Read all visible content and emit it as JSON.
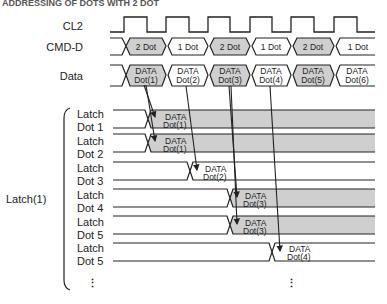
{
  "header": {
    "clipped_text": "ADDRESSING OF DOTS WITH 2 DOT"
  },
  "signals": {
    "cl2": {
      "label": "CL2"
    },
    "cmd_d": {
      "label": "CMD-D",
      "segments": [
        "2 Dot",
        "1 Dot",
        "2 Dot",
        "1 Dot",
        "2 Dot",
        "1 Dot"
      ],
      "shaded": [
        true,
        false,
        true,
        false,
        true,
        false
      ]
    },
    "data": {
      "label": "Data",
      "segments": [
        {
          "l1": "DATA",
          "l2": "Dot(1)",
          "shaded": true
        },
        {
          "l1": "DATA",
          "l2": "Dot(2)",
          "shaded": false
        },
        {
          "l1": "DATA",
          "l2": "Dot(3)",
          "shaded": true
        },
        {
          "l1": "DATA",
          "l2": "Dot(4)",
          "shaded": false
        },
        {
          "l1": "DATA",
          "l2": "Dot(5)",
          "shaded": true
        },
        {
          "l1": "DATA",
          "l2": "Dot(6)",
          "shaded": false
        }
      ]
    }
  },
  "group": {
    "label": "Latch(1)"
  },
  "latches": [
    {
      "l1": "Latch",
      "l2": "Dot 1",
      "d1": "DATA",
      "d2": "Dot(1)",
      "shaded": true
    },
    {
      "l1": "Latch",
      "l2": "Dot 2",
      "d1": "DATA",
      "d2": "Dot(1)",
      "shaded": true
    },
    {
      "l1": "Latch",
      "l2": "Dot 3",
      "d1": "DATA",
      "d2": "Dot(2)",
      "shaded": false
    },
    {
      "l1": "Latch",
      "l2": "Dot 4",
      "d1": "DATA",
      "d2": "Dot(3)",
      "shaded": true
    },
    {
      "l1": "Latch",
      "l2": "Dot 5",
      "d1": "DATA",
      "d2": "Dot(3)",
      "shaded": true
    },
    {
      "l1": "Latch",
      "l2": "Dot 5",
      "d1": "DATA",
      "d2": "Dot(4)",
      "shaded": false
    }
  ],
  "ellipsis": "⋮",
  "colors": {
    "shade": "#cfcfcf",
    "line": "#222222",
    "text": "#222222"
  }
}
